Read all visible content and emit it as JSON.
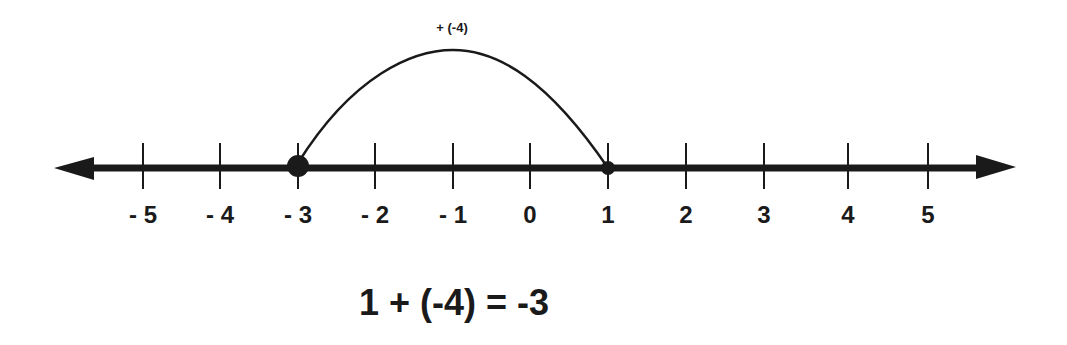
{
  "diagram": {
    "type": "number-line",
    "colors": {
      "ink": "#1a1a1a",
      "background": "#ffffff"
    },
    "axis": {
      "min": -5,
      "max": 5,
      "arrows": "both"
    },
    "ticks": [
      {
        "value": -5,
        "label": "- 5",
        "x": 143
      },
      {
        "value": -4,
        "label": "- 4",
        "x": 220
      },
      {
        "value": -3,
        "label": "- 3",
        "x": 298
      },
      {
        "value": -2,
        "label": "- 2",
        "x": 375
      },
      {
        "value": -1,
        "label": "- 1",
        "x": 453
      },
      {
        "value": 0,
        "label": "0",
        "x": 530
      },
      {
        "value": 1,
        "label": "1",
        "x": 608
      },
      {
        "value": 2,
        "label": "2",
        "x": 686
      },
      {
        "value": 3,
        "label": "3",
        "x": 764
      },
      {
        "value": 4,
        "label": "4",
        "x": 848
      },
      {
        "value": 5,
        "label": "5",
        "x": 928
      }
    ],
    "points": [
      {
        "value": 1,
        "role": "start",
        "size": "small"
      },
      {
        "value": -3,
        "role": "end",
        "size": "large"
      }
    ],
    "jump": {
      "from": 1,
      "to": -3,
      "label": "+ (-4)"
    },
    "equation": "1 + (-4) = -3"
  }
}
